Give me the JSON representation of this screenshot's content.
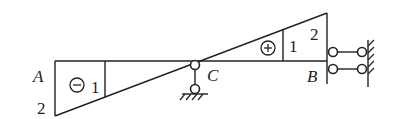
{
  "diagram": {
    "type": "influence-line",
    "points": {
      "A": {
        "label": "A"
      },
      "B": {
        "label": "B"
      },
      "C": {
        "label": "C"
      }
    },
    "ordinates": {
      "left_end": "2",
      "left_mid": "1",
      "right_mid": "1",
      "right_end": "2"
    },
    "regions": {
      "negative_sign": "−",
      "positive_sign": "+"
    },
    "supports": {
      "C": "pin-roller-support",
      "B": "double-link-support-to-wall"
    },
    "colors": {
      "stroke": "#222222",
      "background": "#ffffff"
    }
  }
}
